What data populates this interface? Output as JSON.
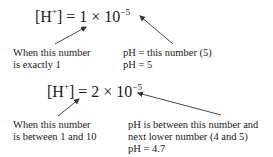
{
  "examples": [
    {
      "equation": {
        "bracket_open": "[H",
        "charge": "+",
        "bracket_close": "] = ",
        "coefficient": "1",
        "times": " × 10",
        "exponent": "−5"
      },
      "left_label": [
        "When this number",
        "is exactly 1"
      ],
      "right_label": [
        "pH = this number (5)",
        "pH = 5"
      ]
    },
    {
      "equation": {
        "bracket_open": "[H",
        "charge": "+",
        "bracket_close": "] = ",
        "coefficient": "2",
        "times": " × 10",
        "exponent": "−5"
      },
      "left_label": [
        "When this number",
        "is between 1 and 10"
      ],
      "right_label": [
        "pH is between this number and",
        "next lower number (4 and 5)",
        "pH = 4.7"
      ]
    }
  ],
  "colors": {
    "text": "#1a1a1a",
    "arrow": "#333333",
    "background": "#ffffff"
  }
}
